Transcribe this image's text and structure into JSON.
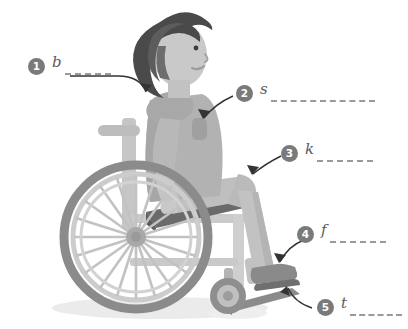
{
  "figure": {
    "orientation": "facing-right",
    "style": "grayscale-flat-illustration",
    "ground_shadow": true
  },
  "palette": {
    "background": "#ffffff",
    "hair_dark": "#4a4a4a",
    "hair_mid": "#6d6d6d",
    "skin": "#c9c9c9",
    "skin_shadow": "#bdbdbd",
    "shirt": "#b2b2b2",
    "shirt_shadow": "#a3a3a3",
    "pants": "#bcbcbc",
    "seat_cushion": "#6a6a6a",
    "frame_light": "#cfcfcf",
    "frame_mid": "#b8b8b8",
    "wheel_tire": "#868686",
    "wheel_spoke": "#c4c4c4",
    "hub": "#9a9a9a",
    "shoe": "#7d7d7d",
    "shadow": "#e8e8e8",
    "callout_circle": "#7a7a7a",
    "callout_number": "#ffffff",
    "callout_letter": "#5b5b5b",
    "callout_line": "#9a9a9a",
    "arrow": "#333333"
  },
  "callouts": [
    {
      "number": "1",
      "letter": "b",
      "answer_blank": "",
      "points_to": "shoulder-back",
      "blank_width": 88,
      "left": 28,
      "top": 58
    },
    {
      "number": "2",
      "letter": "s",
      "answer_blank": "",
      "points_to": "side-torso",
      "blank_width": 104,
      "left": 236,
      "top": 85
    },
    {
      "number": "3",
      "letter": "k",
      "answer_blank": "",
      "points_to": "knee",
      "blank_width": 56,
      "left": 281,
      "top": 145
    },
    {
      "number": "4",
      "letter": "f",
      "answer_blank": "",
      "points_to": "foot",
      "blank_width": 56,
      "left": 297,
      "top": 226
    },
    {
      "number": "5",
      "letter": "t",
      "answer_blank": "",
      "points_to": "toes-footrest",
      "blank_width": 56,
      "left": 317,
      "top": 299
    }
  ]
}
